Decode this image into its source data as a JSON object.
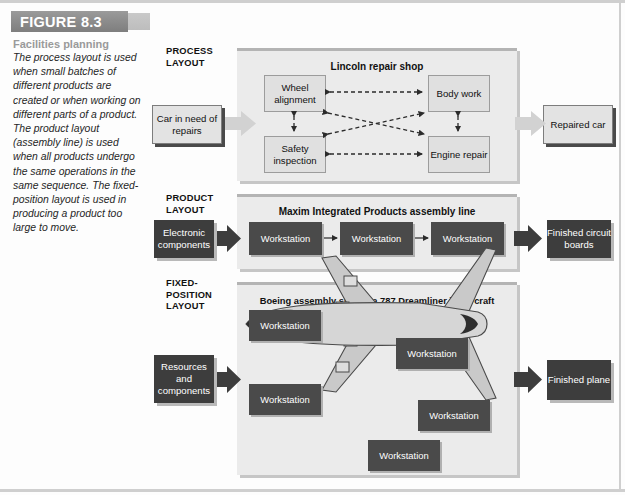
{
  "figure": {
    "badge_label": "FIGURE 8.3",
    "caption_title": "Facilities planning",
    "caption_body": "The process layout is used when small batches of different products are created or when working on different parts of a product. The product layout (assembly line) is used when all products undergo the same operations in the same sequence. The fixed-position layout is used in producing a product too large to move."
  },
  "sections": {
    "process": {
      "label": "PROCESS LAYOUT",
      "panel_title": "Lincoln repair shop",
      "input_label": "Car in need of repairs",
      "output_label": "Repaired car",
      "nodes": [
        {
          "label": "Wheel alignment"
        },
        {
          "label": "Body work"
        },
        {
          "label": "Safety inspection"
        },
        {
          "label": "Engine repair"
        }
      ]
    },
    "product": {
      "label": "PRODUCT LAYOUT",
      "panel_title": "Maxim Integrated Products assembly line",
      "input_label": "Electronic components",
      "output_label": "Finished circuit boards",
      "stations": [
        {
          "label": "Workstation"
        },
        {
          "label": "Workstation"
        },
        {
          "label": "Workstation"
        }
      ]
    },
    "fixed": {
      "label": "FIXED-POSITION LAYOUT",
      "panel_title": "Boeing assembly site for a 787 Dreamliner jet aircraft",
      "input_label": "Resources and components",
      "output_label": "Finished plane",
      "stations": [
        {
          "label": "Workstation"
        },
        {
          "label": "Workstation"
        },
        {
          "label": "Workstation"
        },
        {
          "label": "Workstation"
        },
        {
          "label": "Workstation"
        }
      ],
      "illustration": "airplane-top-view"
    }
  },
  "colors": {
    "badge": "#8d8d8d",
    "panel_bg": "#ebebeb",
    "dark_box": "#3d3d3d",
    "light_box": "#e0e0e0",
    "arrow_light": "#d2d2d2",
    "arrow_dark": "#3d3d3d",
    "caption_title": "#9a9a9a"
  }
}
